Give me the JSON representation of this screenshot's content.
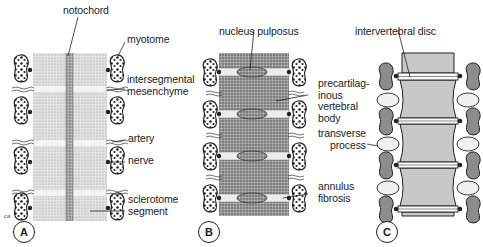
{
  "figure": {
    "panels": [
      {
        "id": "A",
        "letter": "A",
        "labels": {
          "notochord": "notochord",
          "myotome": "myotome",
          "intersegmental": "intersegmental\nmesenchyme",
          "artery": "artery",
          "nerve": "nerve",
          "sclerotome": "sclerotome\nsegment"
        }
      },
      {
        "id": "B",
        "letter": "B",
        "labels": {
          "nucleus": "nucleus pulposus",
          "precartilaginous": "precartilag-\ninous\nvertebral\nbody",
          "annulus": "annulus\nfibrosis"
        }
      },
      {
        "id": "C",
        "letter": "C",
        "labels": {
          "disc": "intervertebral disc",
          "transverse": "transverse\nprocess"
        }
      }
    ],
    "credit": "ca",
    "colors": {
      "ink": "#222222",
      "stipple_light": "#d4d4d4",
      "stipple_dark": "#8e8e8e",
      "band_light": "#ececec",
      "bone": "#f2f2f2"
    }
  }
}
